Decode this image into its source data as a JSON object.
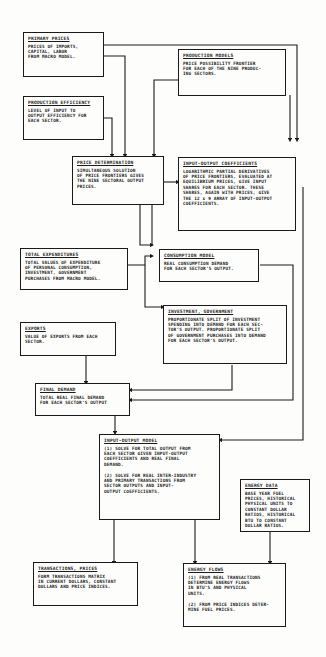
{
  "diagram": {
    "boxes": {
      "primary_prices": {
        "title": "PRIMARY PRICES",
        "body": "PRICES OF IMPORTS,\nCAPITAL, LABOR\nFROM MACRO MODEL."
      },
      "production_models": {
        "title": "PRODUCTION MODELS",
        "body": "PRICE POSSIBILITY FRONTIER\nFOR EACH OF THE NINE PRODUC-\nING SECTORS."
      },
      "production_efficiency": {
        "title": "PRODUCTION EFFICIENCY",
        "body": "LEVEL OF INPUT TO\nOUTPUT EFFICIENCY FOR\nEACH SECTOR."
      },
      "price_determination": {
        "title": "PRICE DETERMINATION",
        "body": "SIMULTANEOUS SOLUTION\nOF PRICE FRONTIERS GIVES\nTHE NINE SECTORAL OUTPUT\nPRICES."
      },
      "input_output_coefficients": {
        "title": "INPUT-OUTPUT COEFFICIENTS",
        "body": "LOGARITHMIC PARTIAL DERIVATIVES\nOF PRICE FRONTIERS, EVALUATED AT\nEQUILIBRIUM PRICES, GIVE INPUT\nSHARES FOR EACH SECTOR.  THESE\nSHARES, AGAIN WITH PRICES, GIVE\nTHE 12 x 9 ARRAY OF INPUT-OUTPUT\nCOEFFICIENTS."
      },
      "total_expenditures": {
        "title": "TOTAL EXPENDITURES",
        "body": "TOTAL VALUES OF EXPENDITURE\nOF PERSONAL CONSUMPTION,\nINVESTMENT, GOVERNMENT\nPURCHASES FROM MACRO MODEL."
      },
      "consumption_model": {
        "title": "CONSUMPTION MODEL",
        "body": "REAL CONSUMPTION DEMAND\nFOR EACH SECTOR'S OUTPUT."
      },
      "investment_government": {
        "title": "INVESTMENT, GOVERNMENT",
        "body": "PROPORTIONATE SPLIT OF INVESTMENT\nSPENDING INTO DEMAND FOR EACH SEC-\nTOR'S OUTPUT.  PROPORTIONATE SPLIT\nOF GOVERNMENT PURCHASES INTO DEMAND\nFOR EACH SECTOR'S OUTPUT."
      },
      "exports": {
        "title": "EXPORTS",
        "body": "VALUE OF EXPORTS FROM EACH\nSECTOR."
      },
      "final_demand": {
        "title": "FINAL DEMAND",
        "body": "TOTAL REAL FINAL DEMAND\nFOR EACH SECTOR'S OUTPUT"
      },
      "input_output_model": {
        "title": "INPUT-OUTPUT MODEL",
        "body": "(1)  SOLVE FOR TOTAL OUTPUT FROM\n      EACH SECTOR GIVEN INPUT-OUTPUT\n      COEFFICIENTS AND REAL FINAL\n      DEMAND.\n\n(2)  SOLVE FOR REAL INTER-INDUSTRY\n      AND PRIMARY TRANSACTIONS FROM\n      SECTOR OUTPUTS AND INPUT-\n      OUTPUT COEFFICIENTS."
      },
      "energy_data": {
        "title": "ENERGY DATA",
        "body": "BASE YEAR FUEL\nPRICES, HISTORICAL\nPHYSICAL UNITS TO\nCONSTANT DOLLAR\nRATIOS, HISTORICAL\nBTU TO CONSTANT\nDOLLAR RATIOS."
      },
      "transactions_prices": {
        "title": "TRANSACTIONS, PRICES",
        "body": "FORM TRANSACTIONS MATRIX\nIN CURRENT DOLLARS, CONSTANT\nDOLLARS AND PRICE INDICES."
      },
      "energy_flows": {
        "title": "ENERGY FLOWS",
        "body": "(1)  FROM REAL TRANSACTIONS\n      DETERMINE ENERGY FLOWS\n      IN BTU'S AND PHYSICAL\n      UNITS.\n\n(2)  FROM PRICE INDICES DETER-\n      MINE FUEL PRICES."
      }
    }
  }
}
